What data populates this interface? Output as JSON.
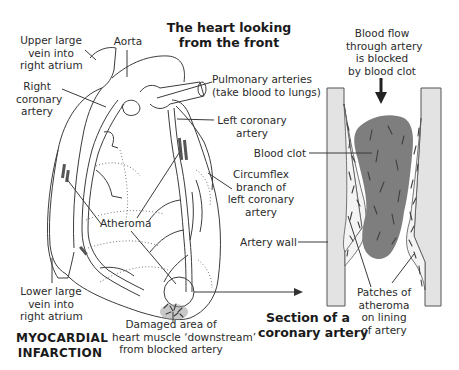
{
  "titles": {
    "heart_front": [
      "The heart looking",
      "from the front"
    ],
    "section": [
      "Section of a",
      "coronary artery"
    ],
    "condition": [
      "MYOCARDIAL",
      "INFARCTION"
    ]
  },
  "labels": {
    "upper_vein": [
      "Upper large",
      "vein into",
      "right atrium"
    ],
    "aorta": "Aorta",
    "right_coronary": [
      "Right",
      "coronary",
      "artery"
    ],
    "pulmonary": [
      "Pulmonary arteries",
      "(take blood to lungs)"
    ],
    "left_coronary": [
      "Left coronary",
      "artery"
    ],
    "circumflex": [
      "Circumflex",
      "branch of",
      "left coronary",
      "artery"
    ],
    "atheroma": "Atheroma",
    "lower_vein": [
      "Lower large",
      "vein into",
      "right atrium"
    ],
    "damaged_area": [
      "Damaged area of",
      "heart muscle ‘downstream’",
      "from blocked artery"
    ],
    "blood_flow": [
      "Blood flow",
      "through artery",
      "is blocked",
      "by blood clot"
    ],
    "blood_clot": "Blood clot",
    "artery_wall": "Artery wall",
    "patches": [
      "Patches of",
      "atheroma",
      "on lining",
      "of artery"
    ]
  },
  "colors": {
    "line": "#3c3c3c",
    "artery_wall_fill": "#e3e3e3",
    "clot_fill": "#7e7e7e",
    "background": "#ffffff"
  }
}
